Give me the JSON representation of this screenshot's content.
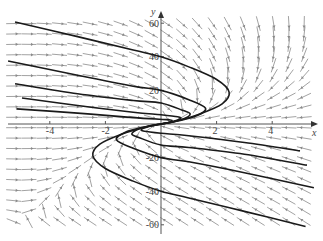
{
  "chart_data": {
    "type": "direction-field",
    "title": "",
    "xlabel": "x",
    "ylabel": "y",
    "xlim": [
      -5.8,
      5.8
    ],
    "ylim": [
      -66,
      62
    ],
    "x_ticks": [
      {
        "value": -4,
        "label": "-4"
      },
      {
        "value": -2,
        "label": "-2"
      },
      {
        "value": 2,
        "label": "2"
      },
      {
        "value": 4,
        "label": "4"
      }
    ],
    "y_ticks": [
      {
        "value": 60,
        "label": "60"
      },
      {
        "value": 40,
        "label": "40"
      },
      {
        "value": 20,
        "label": "20"
      },
      {
        "value": -20,
        "label": "-20"
      },
      {
        "value": -40,
        "label": "-40"
      },
      {
        "value": -60,
        "label": "-60"
      }
    ],
    "grid": false,
    "legend": null,
    "field_arrows": {
      "x_start": -5.3,
      "x_step": 0.55,
      "cols": 20,
      "y_start": -58,
      "y_step": 6.2,
      "rows": 20
    },
    "solution_curves": [
      {
        "points": [
          [
            -5.25,
            60.7
          ],
          [
            -3,
            52
          ],
          [
            -1,
            44
          ],
          [
            0,
            40
          ],
          [
            1,
            34
          ],
          [
            2,
            26.5
          ],
          [
            2.45,
            19
          ],
          [
            2.2,
            12
          ],
          [
            1.4,
            6
          ],
          [
            0.5,
            1.5
          ],
          [
            0,
            0
          ]
        ]
      },
      {
        "points": [
          [
            -5.5,
            37.5
          ],
          [
            -3,
            29
          ],
          [
            -1,
            22.5
          ],
          [
            0,
            20
          ],
          [
            1,
            14.5
          ],
          [
            1.6,
            9.5
          ],
          [
            1.3,
            5
          ],
          [
            0.6,
            1.8
          ],
          [
            0,
            0
          ]
        ]
      },
      {
        "points": [
          [
            -5.25,
            24
          ],
          [
            -3,
            18
          ],
          [
            -1,
            14
          ],
          [
            0,
            12.5
          ],
          [
            0.8,
            8
          ],
          [
            1.05,
            6
          ],
          [
            0.8,
            3
          ],
          [
            0.3,
            0.9
          ],
          [
            0,
            0
          ]
        ]
      },
      {
        "points": [
          [
            -5,
            15.5
          ],
          [
            -3,
            11
          ],
          [
            -1,
            7
          ],
          [
            0,
            5.5
          ],
          [
            0.6,
            4.3
          ],
          [
            0.7,
            3.2
          ],
          [
            0.4,
            1.4
          ],
          [
            0,
            0
          ]
        ]
      },
      {
        "points": [
          [
            -5.2,
            9
          ],
          [
            -3,
            6.5
          ],
          [
            -1,
            3.8
          ],
          [
            0.2,
            2.6
          ],
          [
            0.4,
            2.0
          ],
          [
            0.25,
            0.8
          ],
          [
            0,
            0
          ]
        ]
      },
      {
        "points": [
          [
            5.2,
            -61
          ],
          [
            3,
            -52
          ],
          [
            1,
            -44
          ],
          [
            0,
            -40
          ],
          [
            -1,
            -34
          ],
          [
            -2,
            -26.5
          ],
          [
            -2.45,
            -19
          ],
          [
            -2.2,
            -12
          ],
          [
            -1.4,
            -6
          ],
          [
            -0.5,
            -1.5
          ],
          [
            0,
            0
          ]
        ]
      },
      {
        "points": [
          [
            5.5,
            -38
          ],
          [
            3,
            -29
          ],
          [
            1,
            -22.5
          ],
          [
            0,
            -20
          ],
          [
            -1,
            -14.5
          ],
          [
            -1.6,
            -9.5
          ],
          [
            -1.3,
            -5
          ],
          [
            -0.6,
            -1.8
          ],
          [
            0,
            0
          ]
        ]
      },
      {
        "points": [
          [
            5.25,
            -24.5
          ],
          [
            3,
            -18
          ],
          [
            1,
            -14
          ],
          [
            0,
            -12.5
          ],
          [
            -0.8,
            -8
          ],
          [
            -1.05,
            -6
          ],
          [
            -0.8,
            -3
          ],
          [
            -0.3,
            -0.9
          ],
          [
            0,
            0
          ]
        ]
      },
      {
        "points": [
          [
            5,
            -16
          ],
          [
            3,
            -11
          ],
          [
            1,
            -7
          ],
          [
            0,
            -5.5
          ],
          [
            -0.6,
            -4.3
          ],
          [
            -0.7,
            -3.2
          ],
          [
            -0.4,
            -1.4
          ],
          [
            0,
            0
          ]
        ]
      }
    ],
    "colors": {
      "curves": "#1a1a1a",
      "arrows": "#8a8a8a",
      "axes": "#555555"
    }
  }
}
